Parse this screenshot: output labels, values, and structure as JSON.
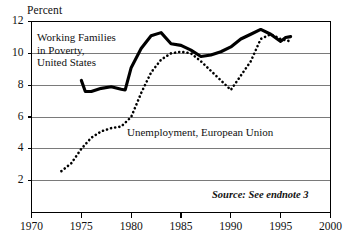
{
  "figure": {
    "ylabel": "Percent",
    "source_note": "Source: See endnote 3",
    "label_us": {
      "line1": "Working Families",
      "line2": "in Poverty,",
      "line3": "United States"
    },
    "label_eu": "Unemployment,  European Union",
    "yticks": [
      "12",
      "10",
      "8",
      "6",
      "4",
      "2"
    ],
    "xticks": [
      "1970",
      "1975",
      "1980",
      "1985",
      "1990",
      "1995",
      "2000"
    ],
    "colors": {
      "line": "#000000",
      "grid": "#7a7a7a",
      "frame": "#000000",
      "background": "#ffffff"
    }
  },
  "chart_data": {
    "type": "line",
    "title": "",
    "xlabel": "",
    "ylabel": "Percent",
    "xlim": [
      1970,
      2000
    ],
    "ylim": [
      0,
      12
    ],
    "grid": true,
    "gridlines_y": [
      2,
      4,
      6,
      8,
      10,
      12
    ],
    "xticks": [
      1970,
      1975,
      1980,
      1985,
      1990,
      1995,
      2000
    ],
    "yticks": [
      2,
      4,
      6,
      8,
      10,
      12
    ],
    "legend": "inline-annotations",
    "annotations": [
      {
        "text": "Working Families in Poverty, United States",
        "x": 1974.5,
        "y": 10.6
      },
      {
        "text": "Unemployment,  European Union",
        "x": 1983.5,
        "y": 5.4
      },
      {
        "text": "Source: See endnote 3",
        "x": 1996.5,
        "y": 1.1
      }
    ],
    "series": [
      {
        "name": "Working Families in Poverty, United States",
        "style": "solid",
        "x": [
          1975,
          1975.4,
          1976,
          1977,
          1978,
          1979,
          1979.4,
          1980,
          1981,
          1982,
          1983,
          1984,
          1985,
          1986,
          1987,
          1988,
          1989,
          1990,
          1991,
          1992,
          1993,
          1994,
          1995,
          1995.5,
          1996
        ],
        "values": [
          8.3,
          7.6,
          7.6,
          7.8,
          7.9,
          7.75,
          7.7,
          9.1,
          10.3,
          11.1,
          11.3,
          10.6,
          10.5,
          10.2,
          9.8,
          9.9,
          10.1,
          10.4,
          10.9,
          11.2,
          11.5,
          11.2,
          10.75,
          11.0,
          11.05
        ]
      },
      {
        "name": "Unemployment, European Union",
        "style": "dotted",
        "x": [
          1973,
          1974,
          1975,
          1976,
          1977,
          1978,
          1979,
          1980,
          1981,
          1982,
          1983,
          1984,
          1985,
          1986,
          1987,
          1988,
          1989,
          1990,
          1991,
          1992,
          1993,
          1994,
          1995,
          1996
        ],
        "values": [
          2.6,
          3.1,
          4.0,
          4.7,
          5.1,
          5.3,
          5.4,
          6.0,
          7.5,
          8.8,
          9.6,
          10.0,
          10.1,
          10.0,
          9.5,
          8.9,
          8.3,
          7.7,
          8.6,
          9.5,
          10.9,
          11.2,
          10.9,
          10.75
        ]
      }
    ]
  }
}
